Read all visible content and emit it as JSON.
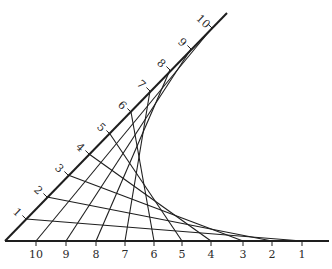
{
  "diagram": {
    "type": "curve-stitching envelope",
    "colors": {
      "ink": "#1e1e1e",
      "background": "#ffffff"
    },
    "vertex": [
      5,
      241
    ],
    "baseline": {
      "end": [
        329,
        241
      ],
      "ticks": [
        {
          "label": "10",
          "x": 36
        },
        {
          "label": "9",
          "x": 66
        },
        {
          "label": "8",
          "x": 96
        },
        {
          "label": "7",
          "x": 125
        },
        {
          "label": "6",
          "x": 154
        },
        {
          "label": "5",
          "x": 182
        },
        {
          "label": "4",
          "x": 211
        },
        {
          "label": "3",
          "x": 243
        },
        {
          "label": "2",
          "x": 272
        },
        {
          "label": "1",
          "x": 302
        }
      ]
    },
    "slant": {
      "end": [
        227,
        13
      ],
      "ticks": [
        {
          "label": "1",
          "x": 26,
          "y": 219
        },
        {
          "label": "2",
          "x": 47,
          "y": 197
        },
        {
          "label": "3",
          "x": 68,
          "y": 175
        },
        {
          "label": "4",
          "x": 89,
          "y": 154
        },
        {
          "label": "5",
          "x": 110,
          "y": 134
        },
        {
          "label": "6",
          "x": 131,
          "y": 112
        },
        {
          "label": "7",
          "x": 150,
          "y": 91
        },
        {
          "label": "8",
          "x": 170,
          "y": 70
        },
        {
          "label": "9",
          "x": 191,
          "y": 49
        },
        {
          "label": "10",
          "x": 212,
          "y": 28
        }
      ]
    },
    "connections": "slant tick k joins baseline tick k"
  }
}
